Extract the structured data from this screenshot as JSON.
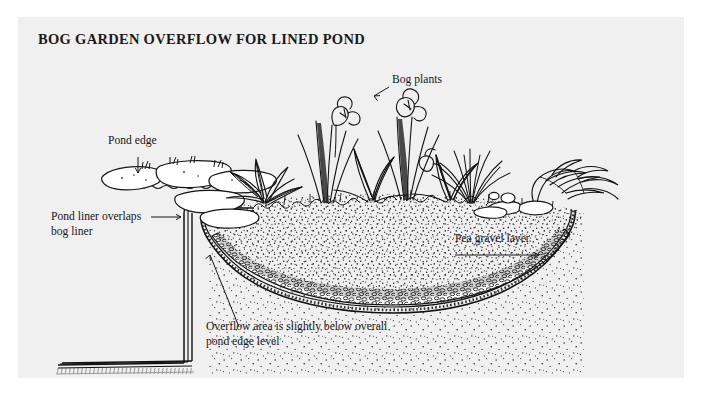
{
  "page": {
    "title": "BOG GARDEN OVERFLOW FOR LINED POND",
    "background_color": "#f0f0f0",
    "ink_color": "#161616",
    "type": "cross-section illustration"
  },
  "labels": {
    "bog_plants": "Bog plants",
    "pond_edge": "Pond edge",
    "pond_liner_line1": "Pond liner overlaps",
    "pond_liner_line2": "bog liner",
    "pea_gravel": "Pea gravel layer",
    "overflow_line1": "Overflow area is slightly below overall",
    "overflow_line2": "pond edge level"
  },
  "diagram": {
    "elements": [
      "bog-plants",
      "pond-edge-stones",
      "water-line",
      "pond-liner-wall",
      "bog-liner",
      "pea-gravel-layer",
      "soil-stipple",
      "pond-floor-liner"
    ]
  }
}
